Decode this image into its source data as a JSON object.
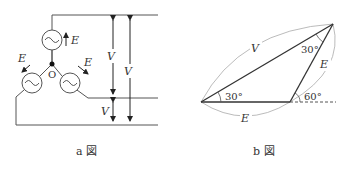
{
  "figure_a": {
    "caption": "a 図",
    "node_label": "O",
    "emf_labels": [
      "E",
      "E",
      "E"
    ],
    "voltage_labels": [
      "V",
      "V",
      "V"
    ]
  },
  "figure_b": {
    "caption": "b 図",
    "side_labels": {
      "hypotenuse": "V",
      "right_side": "E",
      "bottom_side": "E"
    },
    "angle_labels": {
      "left": "30°",
      "top": "30°",
      "exterior": "60°"
    }
  }
}
